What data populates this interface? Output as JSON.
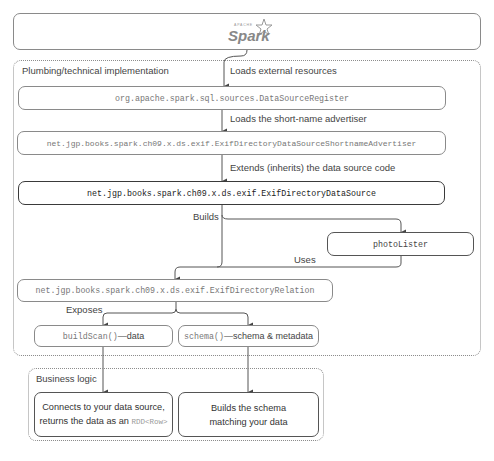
{
  "header": {
    "logo_small": "APACHE",
    "logo_text": "Spark"
  },
  "plumbing": {
    "title": "Plumbing/technical implementation",
    "steps": [
      {
        "edge_label": "Loads external resources",
        "node": "org.apache.spark.sql.sources.DataSourceRegister"
      },
      {
        "edge_label": "Loads the short-name advertiser",
        "node": "net.jgp.books.spark.ch09.x.ds.exif.ExifDirectoryDataSourceShortnameAdvertiser"
      },
      {
        "edge_label": "Extends (inherits) the data source code",
        "node": "net.jgp.books.spark.ch09.x.ds.exif.ExifDirectoryDataSource"
      }
    ],
    "builds_label": "Builds",
    "photo_lister": "photoLister",
    "uses_label": "Uses",
    "relation": "net.jgp.books.spark.ch09.x.ds.exif.ExifDirectoryRelation",
    "exposes_label": "Exposes",
    "build_scan": {
      "code": "buildScan()",
      "text": "—data"
    },
    "schema": {
      "code": "schema()",
      "text": "—schema & metadata"
    }
  },
  "business": {
    "title": "Business logic",
    "left_box": {
      "line1": "Connects to your data source,",
      "line2": "returns the data as an ",
      "code": "RDD<Row>"
    },
    "right_box": {
      "line1": "Builds the schema",
      "line2": "matching your data"
    }
  }
}
